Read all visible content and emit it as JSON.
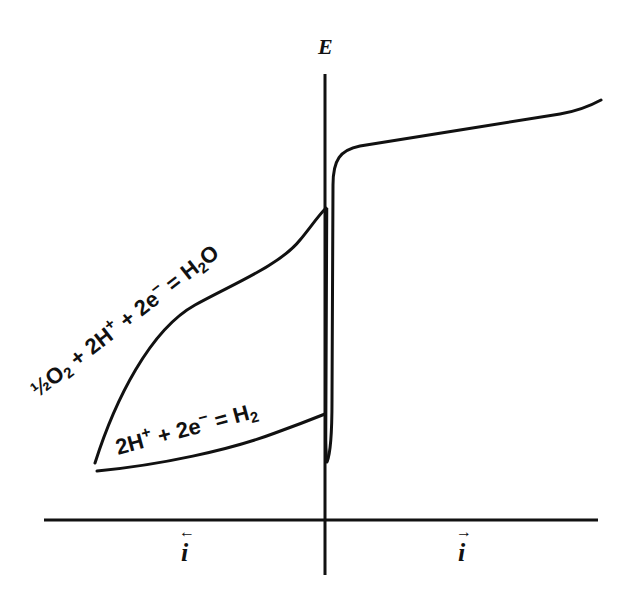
{
  "figure": {
    "type": "polarization-diagram",
    "axes": {
      "vertical": {
        "label": "E"
      },
      "horizontal_left": {
        "label": "i",
        "arrow": "←"
      },
      "horizontal_right": {
        "label": "i",
        "arrow": "→"
      }
    },
    "curves": [
      {
        "id": "oxygen-reduction",
        "label": "½O₂ + 2H⁺ + 2e⁻ = H₂O",
        "side": "cathodic"
      },
      {
        "id": "hydrogen-evolution",
        "label": "2H⁺ + 2e⁻ = H₂",
        "side": "cathodic"
      },
      {
        "id": "anodic-branch",
        "label": "",
        "side": "anodic"
      }
    ],
    "labels": {
      "o2_eq_part1": "½O",
      "o2_eq_sub1": "2",
      "o2_eq_part2": " + 2H",
      "o2_eq_sup1": "+",
      "o2_eq_part3": " + 2e",
      "o2_eq_sup2": "−",
      "o2_eq_part4": " = H",
      "o2_eq_sub2": "2",
      "o2_eq_part5": "O",
      "h2_eq_part1": "2H",
      "h2_eq_sup1": "+",
      "h2_eq_part2": " + 2e",
      "h2_eq_sup2": "−",
      "h2_eq_part3": " = H",
      "h2_eq_sub1": "2"
    },
    "colors": {
      "ink": "#111111",
      "background": "#ffffff"
    }
  }
}
